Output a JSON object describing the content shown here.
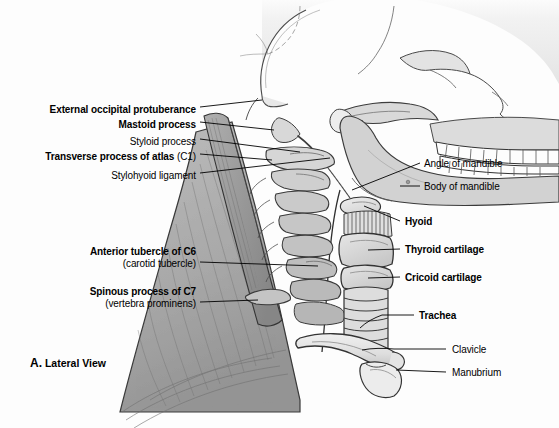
{
  "figure": {
    "caption_letter": "A.",
    "caption_text": "Lateral View",
    "background_color": "#fdfdfd",
    "ink_color": "#1a1a1a"
  },
  "labels_left": [
    {
      "id": "external-occipital-protuberance",
      "text": "External occipital protuberance",
      "bold": true,
      "sub": "",
      "x": 196,
      "y": 110,
      "leader_to_x": 262,
      "leader_to_y": 100
    },
    {
      "id": "mastoid-process",
      "text": "Mastoid process",
      "bold": true,
      "sub": "",
      "x": 196,
      "y": 125,
      "leader_to_x": 266,
      "leader_to_y": 131
    },
    {
      "id": "styloid-process",
      "text": "Styloid process",
      "bold": false,
      "sub": "",
      "x": 196,
      "y": 142,
      "leader_to_x": 272,
      "leader_to_y": 150
    },
    {
      "id": "transverse-process-of-atlas",
      "text": "Transverse process of atlas",
      "bold": true,
      "sub": "(C1)",
      "x": 196,
      "y": 157,
      "leader_to_x": 270,
      "leader_to_y": 163
    },
    {
      "id": "stylohyoid-ligament",
      "text": "Stylohyoid ligament",
      "bold": false,
      "sub": "",
      "x": 196,
      "y": 176,
      "leader_to_x": 276,
      "leader_to_y": 158
    },
    {
      "id": "anterior-tubercle-of-c6",
      "text": "Anterior tubercle of C6",
      "bold": true,
      "sub": "(carotid tubercle)",
      "x": 196,
      "y": 252,
      "leader_to_x": 305,
      "leader_to_y": 262
    },
    {
      "id": "spinous-process-of-c7",
      "text": "Spinous process of C7",
      "bold": true,
      "sub": "(vertebra prominens)",
      "x": 196,
      "y": 292,
      "leader_to_x": 248,
      "leader_to_y": 300
    }
  ],
  "labels_right": [
    {
      "id": "angle-of-mandible",
      "text": "Angle of mandible",
      "bold": false,
      "x": 424,
      "y": 166,
      "leader_from_x": 410,
      "leader_from_y": 166,
      "leader_to_x": 348,
      "leader_to_y": 189
    },
    {
      "id": "body-of-mandible",
      "text": "Body of mandible",
      "bold": false,
      "x": 424,
      "y": 189,
      "leader_from_x": 410,
      "leader_from_y": 189,
      "leader_to_x": 397,
      "leader_to_y": 182
    },
    {
      "id": "hyoid",
      "text": "Hyoid",
      "bold": true,
      "x": 405,
      "y": 224,
      "leader_from_x": 398,
      "leader_from_y": 224,
      "leader_to_x": 365,
      "leader_to_y": 210
    },
    {
      "id": "thyroid-cartilage",
      "text": "Thyroid cartilage",
      "bold": true,
      "x": 405,
      "y": 252,
      "leader_from_x": 396,
      "leader_from_y": 252,
      "leader_to_x": 362,
      "leader_to_y": 253
    },
    {
      "id": "cricoid-cartilage",
      "text": "Cricoid cartilage",
      "bold": true,
      "x": 405,
      "y": 280,
      "leader_from_x": 396,
      "leader_from_y": 280,
      "leader_to_x": 364,
      "leader_to_y": 281
    },
    {
      "id": "trachea",
      "text": "Trachea",
      "bold": true,
      "x": 419,
      "y": 318,
      "leader_from_x": 412,
      "leader_from_y": 318,
      "leader_to_x": 381,
      "leader_to_y": 318
    },
    {
      "id": "clavicle",
      "text": "Clavicle",
      "bold": false,
      "x": 452,
      "y": 352,
      "leader_from_x": 444,
      "leader_from_y": 352,
      "leader_to_x": 395,
      "leader_to_y": 352
    },
    {
      "id": "manubrium",
      "text": "Manubrium",
      "bold": false,
      "x": 452,
      "y": 375,
      "leader_from_x": 444,
      "leader_from_y": 375,
      "leader_to_x": 398,
      "leader_to_y": 373
    }
  ],
  "anatomy_parts": [
    "skull-cranium",
    "frontal-bone",
    "zygomatic-arch",
    "maxilla-teeth",
    "mandible-teeth",
    "angle-of-mandible",
    "body-of-mandible",
    "external-occipital-protuberance",
    "mastoid-process",
    "styloid-process",
    "atlas-c1",
    "cervical-vertebrae",
    "spinous-process-c7",
    "trapezius-muscle",
    "sternocleidomastoid-muscle",
    "hyoid-bone",
    "thyrohyoid-membrane",
    "thyroid-cartilage",
    "cricoid-cartilage",
    "trachea-rings",
    "clavicle",
    "manubrium"
  ]
}
